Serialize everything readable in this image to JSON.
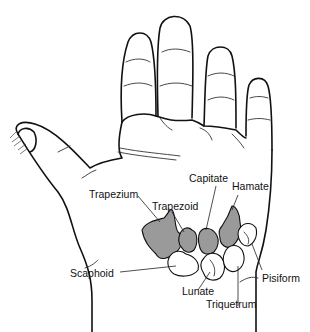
{
  "diagram": {
    "signature": "BAKER",
    "colors": {
      "outline": "#111111",
      "shaded_bone": "#9a9a9a",
      "unshaded_bone": "#ffffff",
      "background": "#ffffff"
    },
    "labels": {
      "trapezium": "Trapezium",
      "trapezoid": "Trapezoid",
      "capitate": "Capitate",
      "hamate": "Hamate",
      "scaphoid": "Scaphoid",
      "lunate": "Lunate",
      "triquetrum": "Triquetrum",
      "pisiform": "Pisiform"
    },
    "bone_groups": {
      "distal_row_shaded": [
        "Trapezium",
        "Trapezoid",
        "Capitate",
        "Hamate"
      ],
      "proximal_row_unshaded": [
        "Scaphoid",
        "Lunate",
        "Triquetrum",
        "Pisiform"
      ]
    }
  }
}
